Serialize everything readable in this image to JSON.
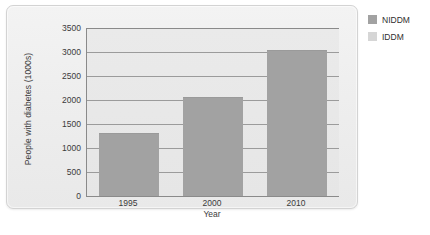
{
  "chart_data": {
    "type": "bar",
    "title": "",
    "xlabel": "Year",
    "ylabel": "People with diabetes (1000s)",
    "categories": [
      "1995",
      "2000",
      "2010"
    ],
    "series": [
      {
        "name": "NIDDM",
        "values": [
          1290,
          2040,
          3020
        ],
        "color": "#a2a2a2"
      }
    ],
    "yticks": [
      0,
      500,
      1000,
      1500,
      2000,
      2500,
      3000,
      3500
    ],
    "ytick_labels": [
      "0",
      "500",
      "1000",
      "1500",
      "2000",
      "2500",
      "3000",
      "3500"
    ],
    "ylim": [
      0,
      3500
    ],
    "grid": true,
    "legend_position": "right",
    "legend": [
      {
        "label": "NIDDM",
        "color": "#a2a2a2"
      },
      {
        "label": "IDDM",
        "color": "#d6d6d6"
      }
    ]
  },
  "colors": {
    "panel_background": "#eeeeee",
    "plot_background": "#e8e8e8",
    "bar": "#a2a2a2",
    "gridline": "#9b9b9b",
    "axis": "#8a8a8a",
    "text": "#3b3b3b"
  }
}
